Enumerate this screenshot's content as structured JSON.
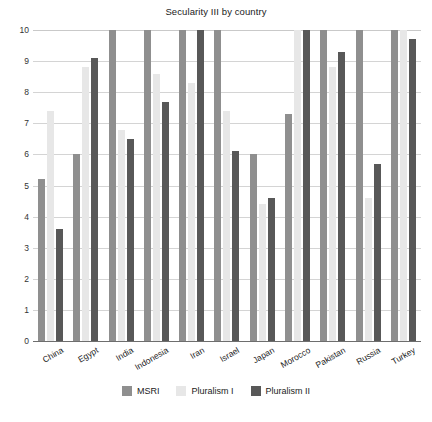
{
  "chart_data": {
    "type": "bar",
    "title": "Secularity III by country",
    "xlabel": "",
    "ylabel": "",
    "ylim": [
      0,
      10
    ],
    "yticks": [
      0,
      1,
      2,
      3,
      4,
      5,
      6,
      7,
      8,
      9,
      10
    ],
    "grid": true,
    "legend_position": "bottom",
    "categories": [
      "China",
      "Egypt",
      "India",
      "Indonesia",
      "Iran",
      "Israel",
      "Japan",
      "Morocco",
      "Pakistan",
      "Russia",
      "Turkey"
    ],
    "series": [
      {
        "name": "MSRI",
        "color": "#8f8f8f",
        "values": [
          5.2,
          6.0,
          10.0,
          10.0,
          10.0,
          10.0,
          6.0,
          7.3,
          10.0,
          10.0,
          10.0
        ]
      },
      {
        "name": "Pluralism I",
        "color": "#e7e7e7",
        "values": [
          7.4,
          8.8,
          6.8,
          8.6,
          8.3,
          7.4,
          4.4,
          10.0,
          8.8,
          4.6,
          10.0
        ]
      },
      {
        "name": "Pluralism II",
        "color": "#585858",
        "values": [
          3.6,
          9.1,
          6.5,
          7.7,
          10.0,
          6.1,
          4.6,
          10.0,
          9.3,
          5.7,
          9.7
        ]
      }
    ]
  },
  "caption": "",
  "colors": {
    "gridline": "#d4d4d4",
    "axis": "#6e6e6e",
    "text": "#1b1b1b"
  }
}
